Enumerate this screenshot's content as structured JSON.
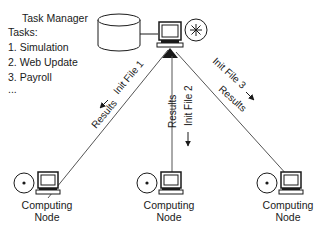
{
  "task_manager": {
    "title": "Task Manager",
    "tasks_label": "Tasks:",
    "tasks": [
      "1. Simulation",
      "2. Web Update",
      "3. Payroll",
      "..."
    ]
  },
  "links": [
    {
      "forward": "Init File 1",
      "back": "Results"
    },
    {
      "forward": "Init File 2",
      "back": "Results"
    },
    {
      "forward": "Init File 3",
      "back": "Results"
    }
  ],
  "nodes": [
    {
      "label_line1": "Computing",
      "label_line2": "Node"
    },
    {
      "label_line1": "Computing",
      "label_line2": "Node"
    },
    {
      "label_line1": "Computing",
      "label_line2": "Node"
    }
  ],
  "colors": {
    "ink": "#1a1a1a",
    "line": "#555555",
    "background": "#ffffff"
  }
}
